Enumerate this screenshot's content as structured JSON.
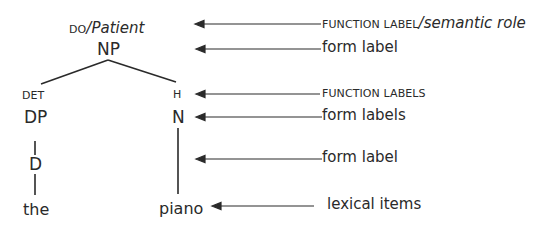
{
  "tree": {
    "root": {
      "function_label": "DO",
      "separator": "/",
      "semantic_role": "Patient",
      "form_label": "NP"
    },
    "left": {
      "function_label": "DET",
      "form_label": "DP",
      "sub_form_label": "D",
      "lexical": "the"
    },
    "right": {
      "function_label": "H",
      "form_label": "N",
      "lexical": "piano"
    }
  },
  "annotations": {
    "row1": {
      "caps": "FUNCTION LABEL",
      "sep": "/",
      "italic": "semantic role"
    },
    "row2": "form label",
    "row3": "FUNCTION LABELS",
    "row4": "form labels",
    "row5": "form label",
    "row6": "lexical items"
  },
  "colors": {
    "ink": "#2a2a2a"
  }
}
